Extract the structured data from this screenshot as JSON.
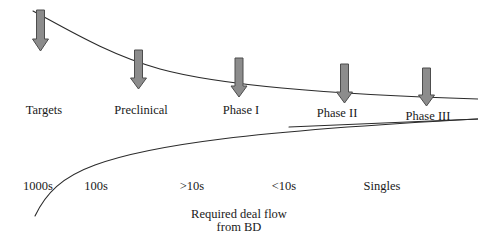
{
  "figure": {
    "title": "",
    "stage_labels": [
      {
        "text": "Targets",
        "x": 44,
        "y": 104
      },
      {
        "text": "Preclinical",
        "x": 141,
        "y": 104
      },
      {
        "text": "Phase I",
        "x": 241,
        "y": 104
      },
      {
        "text": "Phase II",
        "x": 337,
        "y": 106
      },
      {
        "text": "Phase III",
        "x": 428,
        "y": 110
      }
    ],
    "flow_labels": [
      {
        "text": "1000s",
        "x": 38,
        "y": 180
      },
      {
        "text": "100s",
        "x": 96,
        "y": 180
      },
      {
        "text": ">10s",
        "x": 192,
        "y": 180
      },
      {
        "text": "<10s",
        "x": 284,
        "y": 180
      },
      {
        "text": "Singles",
        "x": 382,
        "y": 180
      }
    ],
    "caption": {
      "line1": "Required deal flow",
      "line2": "from BD",
      "x": 239,
      "y": 208
    },
    "arrows": [
      {
        "name": "arrow-targets",
        "cx": 40.5,
        "top": 10,
        "bottom": 51
      },
      {
        "name": "arrow-preclinical",
        "cx": 138.5,
        "top": 50,
        "bottom": 89
      },
      {
        "name": "arrow-phase-i",
        "cx": 239.0,
        "top": 58,
        "bottom": 97
      },
      {
        "name": "arrow-phase-ii",
        "cx": 344.5,
        "top": 64,
        "bottom": 103
      },
      {
        "name": "arrow-phase-iii",
        "cx": 426.5,
        "top": 68,
        "bottom": 106
      }
    ],
    "colors": {
      "arrow_fill": "#8c8c8c",
      "arrow_stroke": "#4d4d4d",
      "curve_stroke": "#2b2b2b",
      "text": "#1a1a1a",
      "background": "#ffffff"
    },
    "curves": {
      "attrition_curve_label": "attrition-curve",
      "platform_line_label": "platform-line",
      "deal_flow_curve_label": "deal-flow-curve"
    }
  }
}
